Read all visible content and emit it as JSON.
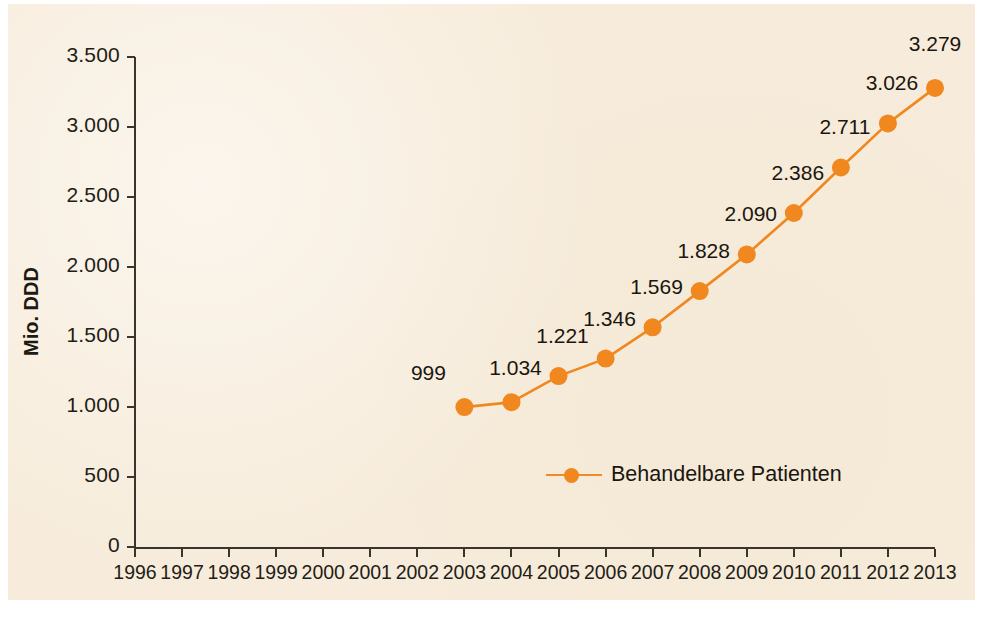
{
  "chart_data": {
    "type": "line",
    "title": "",
    "xlabel": "",
    "ylabel": "Mio. DDD",
    "x": [
      1996,
      1997,
      1998,
      1999,
      2000,
      2001,
      2002,
      2003,
      2004,
      2005,
      2006,
      2007,
      2008,
      2009,
      2010,
      2011,
      2012,
      2013
    ],
    "xtick_labels": [
      "1996",
      "1997",
      "1998",
      "1999",
      "2000",
      "2001",
      "2002",
      "2003",
      "2004",
      "2005",
      "2006",
      "2007",
      "2008",
      "2009",
      "2010",
      "2011",
      "2012",
      "2013"
    ],
    "ytick_labels": [
      "0",
      "500",
      "1.000",
      "1.500",
      "2.000",
      "2.500",
      "3.000",
      "3.500"
    ],
    "ytick_values": [
      0,
      500,
      1000,
      1500,
      2000,
      2500,
      3000,
      3500
    ],
    "ylim": [
      0,
      3500
    ],
    "grid": false,
    "legend_position": "inside-bottom-center",
    "series": [
      {
        "name": "Behandelbare Patienten",
        "color": "#f0871f",
        "x": [
          2003,
          2004,
          2005,
          2006,
          2007,
          2008,
          2009,
          2010,
          2011,
          2012,
          2013
        ],
        "values": [
          999,
          1034,
          1221,
          1346,
          1569,
          1828,
          2090,
          2386,
          2711,
          3026,
          3279
        ],
        "point_labels": [
          "999",
          "1.034",
          "1.221",
          "1.346",
          "1.569",
          "1.828",
          "2.090",
          "2.386",
          "2.711",
          "3.026",
          "3.279"
        ]
      }
    ]
  },
  "legend": {
    "entries": [
      {
        "label": "Behandelbare Patienten",
        "color": "#f0871f",
        "marker": "circle"
      }
    ]
  },
  "colors": {
    "background": "#f7ecdb",
    "series": "#f0871f",
    "axis": "#3a342c",
    "text": "#1a1610"
  }
}
